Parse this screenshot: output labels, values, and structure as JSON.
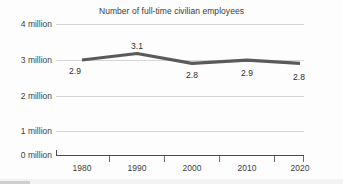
{
  "chart_data": {
    "type": "line",
    "title": "Number of full-time civilian employees",
    "xlabel": "",
    "ylabel": "",
    "categories": [
      "1980",
      "1990",
      "2000",
      "2010",
      "2020"
    ],
    "values": [
      2.9,
      3.1,
      2.8,
      2.9,
      2.8
    ],
    "data_labels": [
      "2.9",
      "3.1",
      "2.8",
      "2.9",
      "2.8"
    ],
    "ylim": [
      0,
      4
    ],
    "y_ticks": [
      0,
      1,
      2,
      3,
      4
    ],
    "y_tick_labels": [
      "0 million",
      "1 million",
      "2 million",
      "3 million",
      "4 million"
    ],
    "x_tick_labels": [
      "1980",
      "1990",
      "2000",
      "2010",
      "2020"
    ],
    "grid": true,
    "legend": null,
    "series": [
      {
        "name": "Full-time civilian employees",
        "values": [
          2.9,
          3.1,
          2.8,
          2.9,
          2.8
        ],
        "color": "#5a5a5a"
      }
    ],
    "colors": {
      "line": "#5a5a5a",
      "grid": "#d6d6d6",
      "axis": "#4a4a4a",
      "text": "#3d3d3d",
      "background": "#fdfdfd"
    }
  },
  "y_axis": {
    "labels": [
      {
        "text": "4 million",
        "value": 4
      },
      {
        "text": "3 million",
        "value": 3
      },
      {
        "text": "2 million",
        "value": 2
      },
      {
        "text": "1 million",
        "value": 1
      },
      {
        "text": "0 million",
        "value": 0
      }
    ]
  },
  "x_axis": {
    "labels": [
      {
        "text": "1980"
      },
      {
        "text": "1990"
      },
      {
        "text": "2000"
      },
      {
        "text": "2010"
      },
      {
        "text": "2020"
      }
    ]
  },
  "point_labels": [
    {
      "text": "2.9"
    },
    {
      "text": "3.1"
    },
    {
      "text": "2.8"
    },
    {
      "text": "2.9"
    },
    {
      "text": "2.8"
    }
  ]
}
